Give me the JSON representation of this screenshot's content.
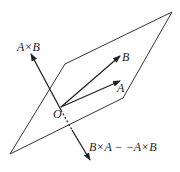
{
  "diagram": {
    "labels": {
      "axb": "A×B",
      "b": "B",
      "a": "A",
      "o": "O",
      "bxa": "B×A − −A×B"
    },
    "colors": {
      "stroke": "#222222",
      "background": "#ffffff"
    }
  }
}
